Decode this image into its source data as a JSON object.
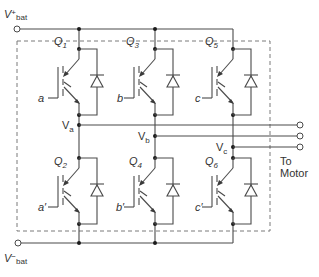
{
  "diagram": {
    "supply": {
      "positive": {
        "label": "V",
        "superscript": "+",
        "subscript": "bat"
      },
      "negative": {
        "label": "V",
        "superscript": "−",
        "subscript": "bat"
      }
    },
    "transistors": [
      {
        "id": "Q1",
        "name": "Q",
        "index": "1",
        "gate": "a",
        "position": "upper",
        "phase": "a"
      },
      {
        "id": "Q3",
        "name": "Q",
        "index": "3",
        "gate": "b",
        "position": "upper",
        "phase": "b"
      },
      {
        "id": "Q5",
        "name": "Q",
        "index": "5",
        "gate": "c",
        "position": "upper",
        "phase": "c"
      },
      {
        "id": "Q2",
        "name": "Q",
        "index": "2",
        "gate": "a′",
        "position": "lower",
        "phase": "a"
      },
      {
        "id": "Q4",
        "name": "Q",
        "index": "4",
        "gate": "b′",
        "position": "lower",
        "phase": "b"
      },
      {
        "id": "Q6",
        "name": "Q",
        "index": "6",
        "gate": "c′",
        "position": "lower",
        "phase": "c"
      }
    ],
    "outputs": [
      {
        "label": "V",
        "subscript": "a"
      },
      {
        "label": "V",
        "subscript": "b"
      },
      {
        "label": "V",
        "subscript": "c"
      }
    ],
    "destination": {
      "line1": "To",
      "line2": "Motor"
    },
    "colors": {
      "wire": "#4a4a4a",
      "dashed_box": "#7a7a7a",
      "node": "#1a1a1a",
      "text": "#333333"
    }
  }
}
